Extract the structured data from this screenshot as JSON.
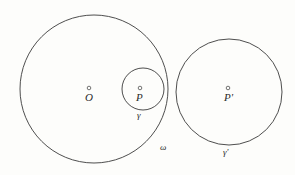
{
  "figure": {
    "background_color": "#fdfdfb",
    "stroke_color": "#3a3a3a",
    "text_color": "#2b2b2b",
    "circles": [
      {
        "name": "omega",
        "label": "ω",
        "cx": 94,
        "cy": 89,
        "r": 74,
        "label_x": 160,
        "label_y": 143
      },
      {
        "name": "gamma",
        "label": "γ",
        "cx": 143,
        "cy": 89,
        "r": 21,
        "label_x": 137,
        "label_y": 111
      },
      {
        "name": "gamma-prime",
        "label": "γ'",
        "cx": 229,
        "cy": 92,
        "r": 53,
        "label_x": 223,
        "label_y": 148
      }
    ],
    "points": [
      {
        "name": "O",
        "label": "O",
        "x": 89,
        "y": 88,
        "label_x": 85,
        "label_y": 92
      },
      {
        "name": "P",
        "label": "P",
        "x": 140,
        "y": 88,
        "label_x": 136,
        "label_y": 92
      },
      {
        "name": "P-prime",
        "label": "P'",
        "x": 228,
        "y": 88,
        "label_x": 224,
        "label_y": 92
      }
    ]
  }
}
